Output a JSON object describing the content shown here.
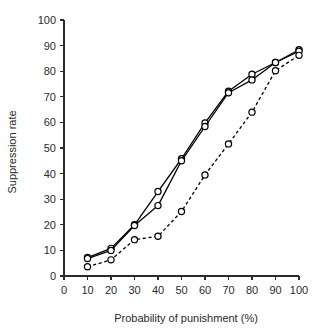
{
  "chart_data": {
    "type": "line",
    "title": "",
    "xlabel": "Probability of punishment (%)",
    "ylabel": "Suppression rate",
    "x": [
      10,
      20,
      30,
      40,
      50,
      60,
      70,
      80,
      90,
      100
    ],
    "xlim": [
      0,
      100
    ],
    "ylim": [
      0,
      100
    ],
    "xticks": [
      0,
      10,
      20,
      30,
      40,
      50,
      60,
      70,
      80,
      90,
      100
    ],
    "yticks": [
      0,
      10,
      20,
      30,
      40,
      50,
      60,
      70,
      80,
      90,
      100
    ],
    "grid": false,
    "legend": "none",
    "marker": "open-circle",
    "series": [
      {
        "name": "Series 1 (solid, upper)",
        "style": "solid",
        "values": [
          7.2,
          10.8,
          20.0,
          33.0,
          45.8,
          59.8,
          72.2,
          78.8,
          83.4,
          88.4
        ]
      },
      {
        "name": "Series 2 (solid, lower)",
        "style": "solid",
        "values": [
          6.8,
          10.0,
          19.7,
          27.5,
          45.0,
          58.4,
          71.6,
          76.6,
          83.4,
          87.8
        ]
      },
      {
        "name": "Series 3 (dashed)",
        "style": "dashed",
        "values": [
          3.6,
          6.3,
          14.2,
          15.5,
          25.2,
          39.5,
          51.6,
          64.0,
          80.2,
          86.2
        ]
      }
    ]
  }
}
